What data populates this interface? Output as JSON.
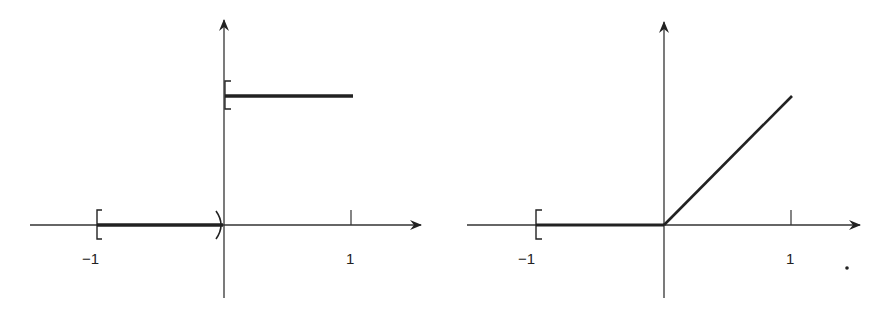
{
  "figure": {
    "panels": [
      {
        "id": "left",
        "description": "Step function: 0 on [-1,0), 1 on [0,1]",
        "x_tick_labels": [
          "−1",
          "1"
        ],
        "segments": [
          {
            "from": [
              -1,
              0
            ],
            "to": [
              0,
              0
            ],
            "left_end": "closed-bracket",
            "right_end": "open-paren"
          },
          {
            "from": [
              0,
              1
            ],
            "to": [
              1,
              1
            ],
            "left_end": "closed-bracket",
            "right_end": "none"
          }
        ]
      },
      {
        "id": "right",
        "description": "Ramp function: 0 on [-1,0], x on [0,1]",
        "x_tick_labels": [
          "−1",
          "1"
        ],
        "segments": [
          {
            "from": [
              -1,
              0
            ],
            "to": [
              0,
              0
            ],
            "left_end": "closed-bracket",
            "right_end": "none"
          },
          {
            "from": [
              0,
              0
            ],
            "to": [
              1,
              1
            ],
            "left_end": "none",
            "right_end": "none"
          }
        ]
      }
    ],
    "trailing_mark": "."
  },
  "colors": {
    "ink": "#222222",
    "background": "#ffffff"
  }
}
